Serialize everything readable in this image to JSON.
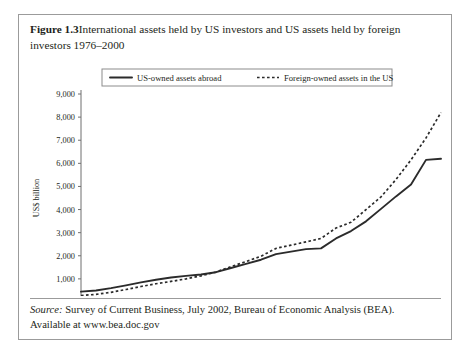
{
  "figure": {
    "label": "Figure 1.3",
    "caption": "International assets held by US investors and US assets held by foreign investors 1976–2000"
  },
  "source": {
    "label": "Source:",
    "line1": " Survey of Current Business, July 2002, Bureau of Economic Analysis (BEA).",
    "line2": "Available at www.bea.doc.gov"
  },
  "chart_data": {
    "type": "line",
    "title": "International assets held by US investors and US assets held by foreign investors 1976–2000",
    "xlabel": "",
    "ylabel": "US$ billion",
    "xlim": [
      1976,
      2000
    ],
    "ylim": [
      0,
      9000
    ],
    "ytick_step": 1000,
    "grid": false,
    "legend_position": "top-center",
    "x": [
      1976,
      1977,
      1978,
      1979,
      1980,
      1981,
      1982,
      1983,
      1984,
      1985,
      1986,
      1987,
      1988,
      1989,
      1990,
      1991,
      1992,
      1993,
      1994,
      1995,
      1996,
      1997,
      1998,
      1999,
      2000
    ],
    "xticks": [
      1976,
      1978,
      1980,
      1982,
      1984,
      1986,
      1988,
      1990,
      1992,
      1994,
      1996,
      1998,
      2000
    ],
    "yticks": [
      0,
      1000,
      2000,
      3000,
      4000,
      5000,
      6000,
      7000,
      8000,
      9000
    ],
    "ytick_labels": [
      "0",
      "1,000",
      "2,000",
      "3,000",
      "4,000",
      "5,000",
      "6,000",
      "7,000",
      "8,000",
      "9,000"
    ],
    "series": [
      {
        "name": "US-owned assets abroad",
        "style": "solid",
        "values": [
          450,
          500,
          600,
          720,
          850,
          960,
          1060,
          1130,
          1190,
          1290,
          1470,
          1650,
          1830,
          2070,
          2180,
          2290,
          2320,
          2750,
          3070,
          3490,
          4030,
          4570,
          5080,
          6150,
          6200
        ]
      },
      {
        "name": "Foreign-owned assets in the US",
        "style": "dotted",
        "values": [
          280,
          330,
          420,
          540,
          670,
          790,
          890,
          1000,
          1130,
          1300,
          1530,
          1750,
          1980,
          2320,
          2460,
          2600,
          2750,
          3200,
          3450,
          4000,
          4550,
          5300,
          6150,
          7100,
          8200
        ]
      }
    ]
  }
}
